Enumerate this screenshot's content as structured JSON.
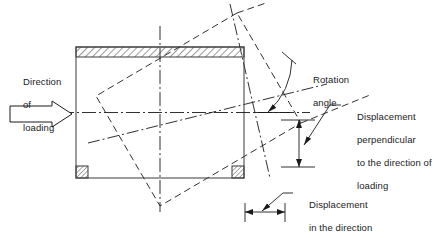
{
  "figure": {
    "type": "engineering-diagram",
    "background_color": "#ffffff",
    "line_color": "#1a1a1a",
    "hatch_color": "#555555"
  },
  "labels": {
    "direction_of_loading": {
      "line1": "Direction",
      "line2": "of",
      "line3": "loading"
    },
    "rotation_angle": {
      "line1": "Rotation",
      "line2": "angle"
    },
    "displacement_perpendicular": {
      "line1": "Displacement",
      "line2": "perpendicular",
      "line3": "to the direction of",
      "line4": "loading"
    },
    "displacement_in_direction": {
      "line1": "Displacement",
      "line2": "in the direction",
      "line3": "of loading"
    }
  },
  "elements": {
    "specimen_box": "undeformed-specimen-outline",
    "rotated_box": "rotated-specimen-outline",
    "load_arrow": "block-arrow-right",
    "rotation_arc": "rotation-angle-arc",
    "vertical_dimension": "perpendicular-displacement-dimension",
    "horizontal_dimension": "loading-direction-displacement-dimension",
    "top_cap": "hatched-top-platen",
    "corner_blocks": "hatched-corner-blocks",
    "centerline_horizontal": "horizontal-centerline",
    "centerline_vertical": "vertical-centerline",
    "rotated_centerline_major": "rotated-major-centerline",
    "rotated_centerline_minor": "rotated-minor-centerline"
  }
}
